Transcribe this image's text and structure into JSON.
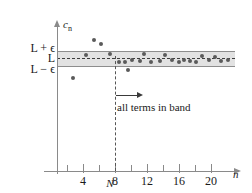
{
  "chart_data": {
    "type": "scatter",
    "title": "",
    "xlabel": "n",
    "ylabel": "c_n",
    "xlim": [
      0,
      21.5
    ],
    "ylim": [
      0,
      1
    ],
    "grid": false,
    "legend": "none",
    "x_ticks": [
      4,
      8,
      12,
      16,
      20
    ],
    "x_tick_labels": [
      "4",
      "8",
      "12",
      "16",
      "20"
    ],
    "x_minor_ticks": [
      2,
      6,
      10,
      14,
      18
    ],
    "y_tick_labels": [
      "L + ϵ",
      "L",
      "L − ϵ"
    ],
    "y_tick_values": [
      "L+epsilon",
      "L",
      "L-epsilon"
    ],
    "band": {
      "label": "epsilon-band",
      "upper": "L + ϵ",
      "lower": "L − ϵ",
      "center": "L",
      "fill_color": "#e2e2e2",
      "edge_color": "#8d8d8d",
      "center_line_color": "#3c3c3c"
    },
    "threshold": {
      "label": "N",
      "x": 9.6,
      "line_style": "dashed",
      "color": "#555555"
    },
    "annotation": {
      "text": "all terms in band",
      "arrow": "right-arrow-from-N"
    },
    "point_color": "#5a5a5a",
    "points": [
      {
        "n": 3,
        "c": "below band"
      },
      {
        "n": 4,
        "c": "at upper edge"
      },
      {
        "n": 5,
        "c": "above band"
      },
      {
        "n": 5.7,
        "c": "above band"
      },
      {
        "n": 6.6,
        "c": "at upper edge"
      },
      {
        "n": 8.1,
        "c": "in band"
      },
      {
        "n": 8.8,
        "c": "in band"
      },
      {
        "n": 9.3,
        "c": "below band"
      },
      {
        "n": 9.6,
        "c": "in band"
      },
      {
        "n": 10.5,
        "c": "in band"
      },
      {
        "n": 11,
        "c": "near upper edge"
      },
      {
        "n": 11.8,
        "c": "in band"
      },
      {
        "n": 12.7,
        "c": "in band"
      },
      {
        "n": 13.2,
        "c": "near upper edge"
      },
      {
        "n": 14,
        "c": "in band"
      },
      {
        "n": 14.8,
        "c": "in band"
      },
      {
        "n": 15.4,
        "c": "in band"
      },
      {
        "n": 16.1,
        "c": "in band"
      },
      {
        "n": 16.8,
        "c": "in band"
      },
      {
        "n": 17.5,
        "c": "near upper edge"
      },
      {
        "n": 18.3,
        "c": "in band"
      },
      {
        "n": 19,
        "c": "near upper edge"
      },
      {
        "n": 19.8,
        "c": "in band"
      },
      {
        "n": 20.4,
        "c": "in band"
      }
    ],
    "pixel_points": [
      {
        "x": 73,
        "y": 78
      },
      {
        "x": 86,
        "y": 55
      },
      {
        "x": 94,
        "y": 40
      },
      {
        "x": 101,
        "y": 44
      },
      {
        "x": 110,
        "y": 54
      },
      {
        "x": 119,
        "y": 62
      },
      {
        "x": 125,
        "y": 62
      },
      {
        "x": 128,
        "y": 70
      },
      {
        "x": 132,
        "y": 60
      },
      {
        "x": 140,
        "y": 61
      },
      {
        "x": 144,
        "y": 54
      },
      {
        "x": 151,
        "y": 62
      },
      {
        "x": 160,
        "y": 61
      },
      {
        "x": 165,
        "y": 55
      },
      {
        "x": 172,
        "y": 60
      },
      {
        "x": 179,
        "y": 62
      },
      {
        "x": 184,
        "y": 60
      },
      {
        "x": 190,
        "y": 61
      },
      {
        "x": 196,
        "y": 62
      },
      {
        "x": 202,
        "y": 56
      },
      {
        "x": 209,
        "y": 60
      },
      {
        "x": 215,
        "y": 57
      },
      {
        "x": 221,
        "y": 61
      },
      {
        "x": 228,
        "y": 60
      }
    ]
  },
  "labels": {
    "y_axis_title": "c",
    "y_axis_subscript": "n",
    "x_axis_title": "n",
    "threshold_label": "N",
    "upper": "L + ϵ",
    "center": "L",
    "lower": "L − ϵ",
    "annotation": "all terms in band",
    "tick_4": "4",
    "tick_8": "8",
    "tick_12": "12",
    "tick_16": "16",
    "tick_20": "20"
  }
}
